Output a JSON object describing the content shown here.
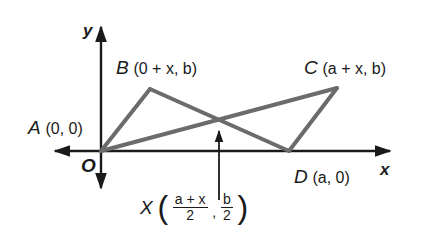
{
  "figure": {
    "axes": {
      "x_label": "x",
      "y_label": "y",
      "origin_label": "O",
      "axis_color": "#1a1a1a"
    },
    "points": {
      "A": {
        "name": "A",
        "coords": "(0, 0)"
      },
      "B": {
        "name": "B",
        "coords": "(0 + x, b)"
      },
      "C": {
        "name": "C",
        "coords": "(a + x, b)"
      },
      "D": {
        "name": "D",
        "coords": "(a, 0)"
      },
      "X": {
        "name": "X",
        "x_numerator": "a + x",
        "x_denominator": "2",
        "separator": ",",
        "y_numerator": "b",
        "y_denominator": "2",
        "open_paren": "(",
        "close_paren": ")"
      }
    },
    "shape": {
      "type": "parallelogram ABCD with diagonals AC and BD intersecting at X",
      "edge_color": "#6b6b6b",
      "segments": [
        "A-B",
        "B-D",
        "A-C",
        "C-D"
      ]
    }
  }
}
